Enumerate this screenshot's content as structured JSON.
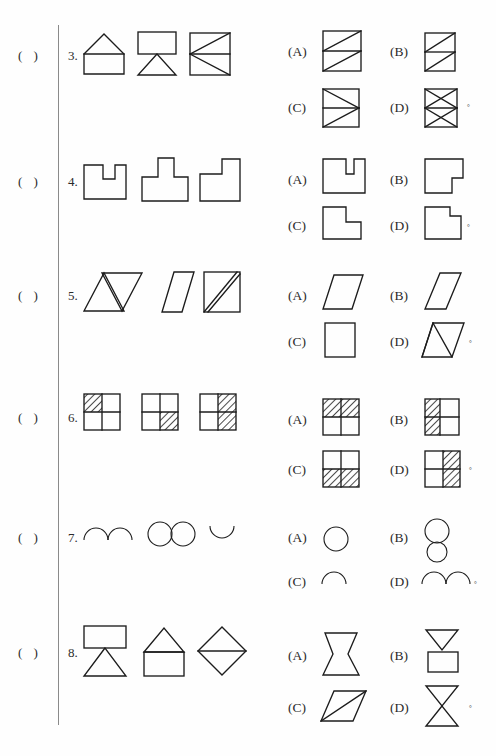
{
  "page": {
    "background_color": "#fefefe",
    "ink_color": "#1c1c1c",
    "divider_color": "#8a8a8a",
    "answer_bracket": "(  )",
    "degree_mark": "°"
  },
  "questions": [
    {
      "number": "3.",
      "answer_bracket": "(  )",
      "stem_shapes": [
        "house-pentagon-with-baseline",
        "rectangle-over-downward-triangle",
        "square-with-midline-and-two-diagonals"
      ],
      "options": [
        {
          "label": "(A)",
          "shape": "square-midline-two-parallel-diagonals-up"
        },
        {
          "label": "(B)",
          "shape": "tall-rect-midline-two-parallel-diagonals-up"
        },
        {
          "label": "(C)",
          "shape": "square-midline-left-vertex-two-diagonals"
        },
        {
          "label": "(D)",
          "shape": "tall-rect-midline-two-crossed-x"
        }
      ]
    },
    {
      "number": "4.",
      "answer_bracket": "(  )",
      "stem_shapes": [
        "square-with-top-notch",
        "square-with-top-tab",
        "square-with-top-right-notch"
      ],
      "options": [
        {
          "label": "(A)",
          "shape": "wide-rect-with-narrow-top-notch"
        },
        {
          "label": "(B)",
          "shape": "rect-with-bottom-right-step-notch"
        },
        {
          "label": "(C)",
          "shape": "L-shape-step-right"
        },
        {
          "label": "(D)",
          "shape": "square-with-small-top-right-notch"
        }
      ]
    },
    {
      "number": "5.",
      "answer_bracket": "(  )",
      "stem_shapes": [
        "two-overlapping-triangles-up-and-down",
        "parallelogram-leaning-left",
        "square-with-double-diagonal-stripe"
      ],
      "options": [
        {
          "label": "(A)",
          "shape": "parallelogram-leaning-left"
        },
        {
          "label": "(B)",
          "shape": "parallelogram-leaning-right"
        },
        {
          "label": "(C)",
          "shape": "plain-square"
        },
        {
          "label": "(D)",
          "shape": "parallelogram-with-internal-triangle"
        }
      ]
    },
    {
      "number": "6.",
      "answer_bracket": "(  )",
      "stem_shapes": [
        "2x2-grid-top-left-hatched",
        "2x2-grid-bottom-right-hatched",
        "2x2-grid-right-column-hatched"
      ],
      "options": [
        {
          "label": "(A)",
          "shape": "2x2-grid-top-row-hatched"
        },
        {
          "label": "(B)",
          "shape": "2x2-grid-left-column-hatched"
        },
        {
          "label": "(C)",
          "shape": "2x2-grid-bottom-row-hatched"
        },
        {
          "label": "(D)",
          "shape": "2x2-grid-right-column-hatched"
        }
      ]
    },
    {
      "number": "7.",
      "answer_bracket": "(  )",
      "stem_shapes": [
        "two-upward-arcs",
        "two-circles-side-by-side",
        "one-downward-arc"
      ],
      "options": [
        {
          "label": "(A)",
          "shape": "single-circle"
        },
        {
          "label": "(B)",
          "shape": "two-stacked-circles"
        },
        {
          "label": "(C)",
          "shape": "single-upward-arc"
        },
        {
          "label": "(D)",
          "shape": "two-upward-arcs"
        }
      ]
    },
    {
      "number": "8.",
      "answer_bracket": "(  )",
      "stem_shapes": [
        "rectangle-above-downward-triangle",
        "house-triangle-on-rectangle",
        "diamond-with-horizontal-midline"
      ],
      "options": [
        {
          "label": "(A)",
          "shape": "concave-hourglass-rectangle"
        },
        {
          "label": "(B)",
          "shape": "downward-triangle-above-rectangle"
        },
        {
          "label": "(C)",
          "shape": "parallelogram-with-diagonal"
        },
        {
          "label": "(D)",
          "shape": "hourglass-two-triangles"
        }
      ]
    }
  ]
}
